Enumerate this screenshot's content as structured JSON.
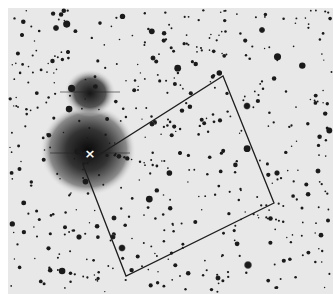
{
  "image": {
    "description": "Inverted (negative) astronomical star field with a rotated rectangular field-of-view box and an X marker on a bright star",
    "background_color": "#e8e8e8",
    "star_color": "#1a1a1a",
    "marker": {
      "symbol": "×",
      "x": 90,
      "y": 154,
      "color": "#ffffff"
    },
    "fov_box": {
      "points": [
        [
          223,
          76
        ],
        [
          274,
          203
        ],
        [
          126,
          276
        ],
        [
          83,
          165
        ]
      ],
      "stroke": "#1e1e1e"
    },
    "glows": [
      {
        "cx": 88,
        "cy": 148,
        "r": 44
      },
      {
        "cx": 90,
        "cy": 93,
        "r": 22
      }
    ]
  }
}
